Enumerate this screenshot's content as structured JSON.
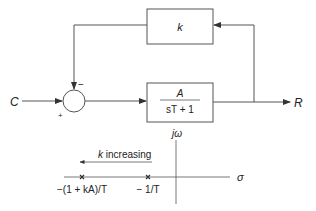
{
  "block_diagram": {
    "input_label": "C",
    "output_label": "R",
    "feedback_block": {
      "label": "k"
    },
    "plant_block": {
      "numerator": "A",
      "denominator": "sT + 1"
    },
    "summer": {
      "plus_sign": "+",
      "minus_sign": "−"
    }
  },
  "s_plane": {
    "imag_axis_label": "jω",
    "real_axis_label": "σ",
    "arrow_label": "k increasing",
    "poles": [
      {
        "label": "−(1 + kA)/T",
        "marker": "x"
      },
      {
        "label": "− 1/T",
        "marker": "x"
      }
    ]
  },
  "colors": {
    "line": "#555555",
    "text": "#222222",
    "background": "#ffffff"
  }
}
